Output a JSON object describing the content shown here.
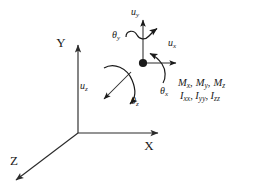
{
  "diagram": {
    "global_axes": [
      {
        "name": "y-axis",
        "label": "Y",
        "direction": "up"
      },
      {
        "name": "x-axis",
        "label": "X",
        "direction": "right"
      },
      {
        "name": "z-axis",
        "label": "Z",
        "direction": "down-left"
      }
    ],
    "node": {
      "name": "node-point",
      "shape": "filled-circle"
    },
    "translations": [
      {
        "name": "translation-x",
        "symbol": "u",
        "subscript": "x",
        "direction": "right"
      },
      {
        "name": "translation-y",
        "symbol": "u",
        "subscript": "y",
        "direction": "up"
      },
      {
        "name": "translation-z",
        "symbol": "u",
        "subscript": "z",
        "direction": "down-left"
      }
    ],
    "rotations": [
      {
        "name": "rotation-x",
        "symbol": "θ",
        "subscript": "x",
        "about": "x-axis"
      },
      {
        "name": "rotation-y",
        "symbol": "θ",
        "subscript": "y",
        "about": "y-axis"
      },
      {
        "name": "rotation-z",
        "symbol": "θ",
        "subscript": "z",
        "about": "z-axis"
      }
    ],
    "properties": {
      "moments": {
        "name": "moments-line",
        "items": [
          {
            "symbol": "M",
            "subscript": "x"
          },
          {
            "symbol": "M",
            "subscript": "y"
          },
          {
            "symbol": "M",
            "subscript": "z"
          }
        ],
        "text": "Mₓ, Mᵧ, M_z"
      },
      "inertias": {
        "name": "inertias-line",
        "items": [
          {
            "symbol": "I",
            "subscript": "xx"
          },
          {
            "symbol": "I",
            "subscript": "yy"
          },
          {
            "symbol": "I",
            "subscript": "zz"
          }
        ],
        "text": "I_xx, I_yy, I_zz"
      },
      "separator_comma": ",",
      "symbol_M": "M",
      "symbol_I": "I",
      "symbol_u": "u",
      "symbol_theta": "θ",
      "sub_x": "x",
      "sub_y": "y",
      "sub_z": "z",
      "sub_xx": "xx",
      "sub_yy": "yy",
      "sub_zz": "zz"
    },
    "colors": {
      "background": "#ffffff",
      "ink": "#1a1a1a",
      "axis": "#2b2b2b"
    }
  }
}
